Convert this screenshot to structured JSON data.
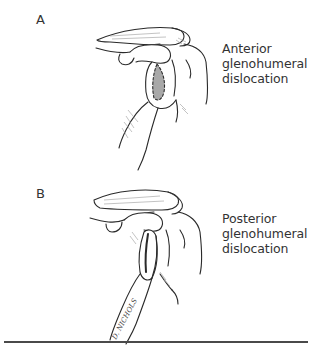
{
  "panels": [
    {
      "letter": "A",
      "caption": [
        "Anterior",
        "glenohumeral",
        "dislocation"
      ],
      "highlight_color": "#a8a8a8"
    },
    {
      "letter": "B",
      "caption": [
        "Posterior",
        "glenohumeral",
        "dislocation"
      ],
      "signature": "D. NICHOLS"
    }
  ],
  "colors": {
    "line": "#2a2a2a",
    "shade": "#9a9a9a",
    "rule": "#4a4a4a"
  }
}
